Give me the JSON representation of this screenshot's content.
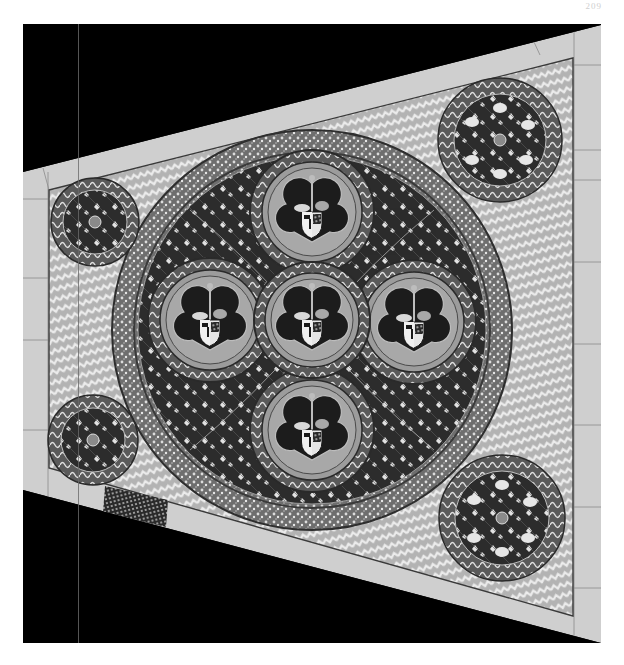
{
  "page": {
    "number": "209",
    "background": "#ffffff"
  },
  "plate": {
    "subject": "Mosaic pavement with heraldic medallions",
    "frame": {
      "left": 23,
      "top": 24,
      "right": 601,
      "bottom": 643,
      "color": "#000000"
    },
    "floor_polygon": {
      "top_left": [
        23,
        172
      ],
      "top_right": [
        601,
        25
      ],
      "bottom_right": [
        601,
        643
      ],
      "bottom_left": [
        23,
        490
      ]
    },
    "colors": {
      "stone": "#cfcfcf",
      "stone_seam": "#8a8a8a",
      "field": "#b8b8b8",
      "field_pattern": "#e6e6e6",
      "ring_dark": "#2e2e2e",
      "ring_mid": "#7a7a7a",
      "ring_light": "#d8d8d8",
      "leaf": "#e9e9e9",
      "shield_dark": "#1a1a1a"
    },
    "central_roundel": {
      "cx": 312,
      "cy": 330,
      "r": 200
    },
    "heraldic_medallions": [
      {
        "name": "top",
        "cx": 312,
        "cy": 212,
        "r": 62
      },
      {
        "name": "left",
        "cx": 210,
        "cy": 320,
        "r": 62
      },
      {
        "name": "center",
        "cx": 312,
        "cy": 320,
        "r": 58
      },
      {
        "name": "right",
        "cx": 414,
        "cy": 322,
        "r": 62
      },
      {
        "name": "bottom",
        "cx": 312,
        "cy": 430,
        "r": 62
      }
    ],
    "corner_medallions": [
      {
        "name": "top-left",
        "cx": 95,
        "cy": 222,
        "r": 44
      },
      {
        "name": "bottom-left",
        "cx": 93,
        "cy": 440,
        "r": 45
      },
      {
        "name": "top-right",
        "cx": 500,
        "cy": 140,
        "r": 62
      },
      {
        "name": "bottom-right",
        "cx": 502,
        "cy": 518,
        "r": 63
      }
    ],
    "grate": {
      "x": 105,
      "y": 488,
      "w": 63,
      "h": 37
    }
  }
}
